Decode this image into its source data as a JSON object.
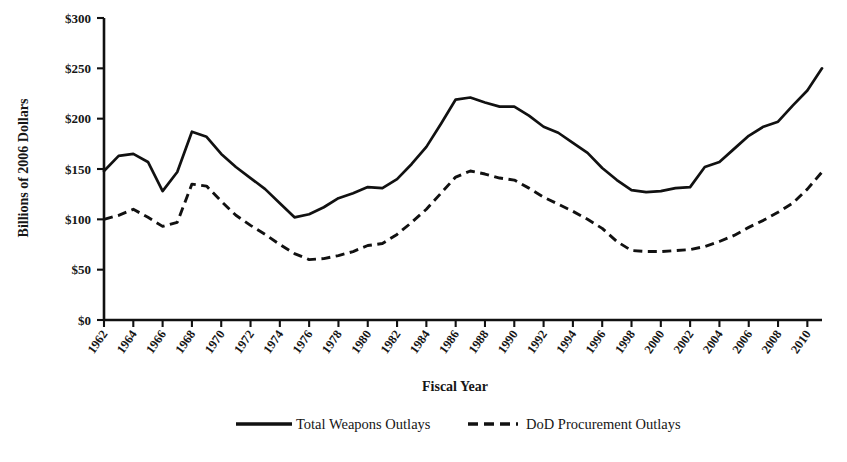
{
  "chart_data": {
    "type": "line",
    "title": "",
    "xlabel": "Fiscal Year",
    "ylabel": "Billions of 2006 Dollars",
    "xlim": [
      1962,
      2011
    ],
    "ylim": [
      0,
      300
    ],
    "ytick_values": [
      0,
      50,
      100,
      150,
      200,
      250,
      300
    ],
    "ytick_labels": [
      "$0",
      "$50",
      "$100",
      "$150",
      "$200",
      "$250",
      "$300"
    ],
    "xtick_labels": [
      "1962",
      "1964",
      "1966",
      "1968",
      "1970",
      "1972",
      "1974",
      "1976",
      "1978",
      "1980",
      "1982",
      "1984",
      "1986",
      "1988",
      "1990",
      "1992",
      "1994",
      "1996",
      "1998",
      "2000",
      "2002",
      "2004",
      "2006",
      "2008",
      "2010"
    ],
    "grid": false,
    "legend_position": "bottom",
    "x": [
      1962,
      1963,
      1964,
      1965,
      1966,
      1967,
      1968,
      1969,
      1970,
      1971,
      1972,
      1973,
      1974,
      1975,
      1976,
      1977,
      1978,
      1979,
      1980,
      1981,
      1982,
      1983,
      1984,
      1985,
      1986,
      1987,
      1988,
      1989,
      1990,
      1991,
      1992,
      1993,
      1994,
      1995,
      1996,
      1997,
      1998,
      1999,
      2000,
      2001,
      2002,
      2003,
      2004,
      2005,
      2006,
      2007,
      2008,
      2009,
      2010,
      2011
    ],
    "series": [
      {
        "name": "Total Weapons Outlays",
        "style": "solid",
        "color": "#111111",
        "values": [
          148,
          163,
          165,
          157,
          128,
          147,
          187,
          182,
          165,
          152,
          141,
          130,
          116,
          102,
          105,
          112,
          121,
          126,
          132,
          131,
          140,
          155,
          172,
          195,
          219,
          221,
          216,
          212,
          212,
          203,
          192,
          186,
          176,
          166,
          151,
          139,
          129,
          127,
          128,
          131,
          132,
          152,
          157,
          170,
          183,
          192,
          197,
          213,
          228,
          250
        ]
      },
      {
        "name": "DoD Procurement Outlays",
        "style": "dashed",
        "color": "#111111",
        "values": [
          100,
          104,
          110,
          102,
          93,
          97,
          135,
          133,
          118,
          104,
          94,
          85,
          75,
          66,
          60,
          61,
          64,
          68,
          74,
          76,
          85,
          97,
          110,
          126,
          142,
          148,
          145,
          141,
          139,
          131,
          122,
          115,
          108,
          100,
          91,
          78,
          69,
          68,
          68,
          69,
          70,
          73,
          78,
          84,
          92,
          99,
          107,
          116,
          130,
          147
        ]
      }
    ]
  },
  "legend": {
    "items": [
      {
        "label": "Total Weapons Outlays",
        "marker": "solid-line"
      },
      {
        "label": "DoD Procurement Outlays",
        "marker": "dashed-line"
      }
    ]
  }
}
